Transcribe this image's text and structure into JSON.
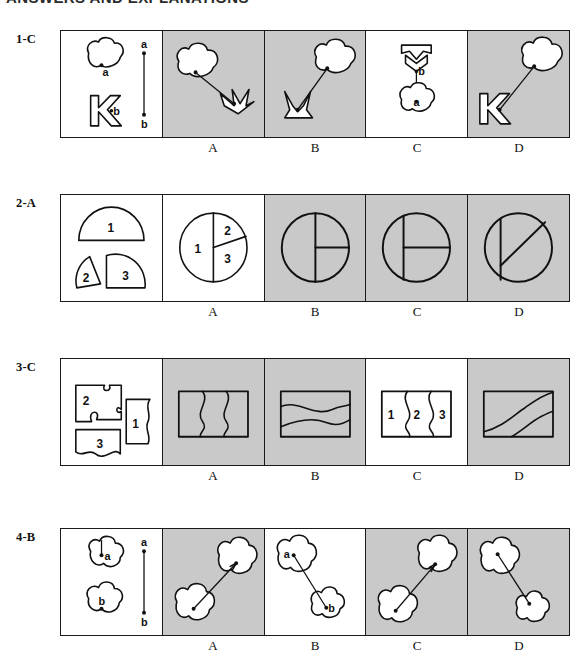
{
  "page": {
    "heading": "ANSWERS AND EXPLANATIONS",
    "background_color": "#ffffff",
    "shaded_panel_color": "#c9c9c9",
    "plain_panel_color": "#ffffff",
    "ink_color": "#111111"
  },
  "option_letters": [
    "A",
    "B",
    "C",
    "D"
  ],
  "rows": [
    {
      "label": "1-C",
      "answer": "C",
      "prompt": {
        "shape_labels": [
          "a",
          "b"
        ],
        "reference_line_labels": [
          "a",
          "b"
        ],
        "description": "cloud marked a, hollow block letter K marked b, vertical reference segment from a to b"
      },
      "options": [
        {
          "letter": "A",
          "shaded": true,
          "description": "cloud at upper-left joined by line to arrow-chevron shape at lower-right"
        },
        {
          "letter": "B",
          "shaded": true,
          "description": "cloud at upper-right joined by line to chevron shape at lower-left"
        },
        {
          "letter": "C",
          "shaded": false,
          "description": "chevron labeled b above, cloud labeled a below, vertical connector"
        },
        {
          "letter": "D",
          "shaded": true,
          "description": "cloud upper-right joined by line to hollow K at lower-left"
        }
      ]
    },
    {
      "label": "2-A",
      "answer": "A",
      "prompt": {
        "shape_labels": [
          "1",
          "2",
          "3"
        ],
        "description": "half disc labeled 1, small wedge labeled 2, quarter wedge labeled 3"
      },
      "options": [
        {
          "letter": "A",
          "shaded": false,
          "description": "circle split into sector 1 (left half), sector 2 (upper right), sector 3 (lower right)",
          "sector_labels": [
            "1",
            "2",
            "3"
          ]
        },
        {
          "letter": "B",
          "shaded": true,
          "description": "circle with full vertical diameter and horizontal radius to the right"
        },
        {
          "letter": "C",
          "shaded": true,
          "description": "circle with chord vertical on left and horizontal chord across middle"
        },
        {
          "letter": "D",
          "shaded": true,
          "description": "circle with diagonal line and short vertical chord on the left"
        }
      ]
    },
    {
      "label": "3-C",
      "answer": "C",
      "prompt": {
        "shape_labels": [
          "2",
          "1",
          "3"
        ],
        "description": "three jigsaw pieces: piece 2 upper-left, piece 1 at right, piece 3 lower-left"
      },
      "options": [
        {
          "letter": "A",
          "shaded": true,
          "description": "rectangle crossed by two vertical wavy lines"
        },
        {
          "letter": "B",
          "shaded": true,
          "description": "rectangle crossed by two horizontal wavy lines"
        },
        {
          "letter": "C",
          "shaded": false,
          "description": "rectangle divided by two vertical wavy lines into regions 1, 2 and 3",
          "region_labels": [
            "1",
            "2",
            "3"
          ]
        },
        {
          "letter": "D",
          "shaded": true,
          "description": "rectangle crossed by two sweeping diagonal curves"
        }
      ]
    },
    {
      "label": "4-B",
      "answer": "B",
      "prompt": {
        "shape_labels": [
          "a",
          "b"
        ],
        "reference_line_labels": [
          "a",
          "b"
        ],
        "description": "cloud with radius marked a, cloud with radius marked b, vertical reference segment from a to b"
      },
      "options": [
        {
          "letter": "A",
          "shaded": true,
          "description": "small cloud lower-left joined to larger cloud upper-right"
        },
        {
          "letter": "B",
          "shaded": false,
          "description": "cloud a upper-left joined by line to cloud b lower-right",
          "point_labels": [
            "a",
            "b"
          ]
        },
        {
          "letter": "C",
          "shaded": true,
          "description": "cloud lower-left joined to cloud upper-right by line"
        },
        {
          "letter": "D",
          "shaded": true,
          "description": "cloud upper-left joined to cloud lower-right by line"
        }
      ]
    }
  ]
}
